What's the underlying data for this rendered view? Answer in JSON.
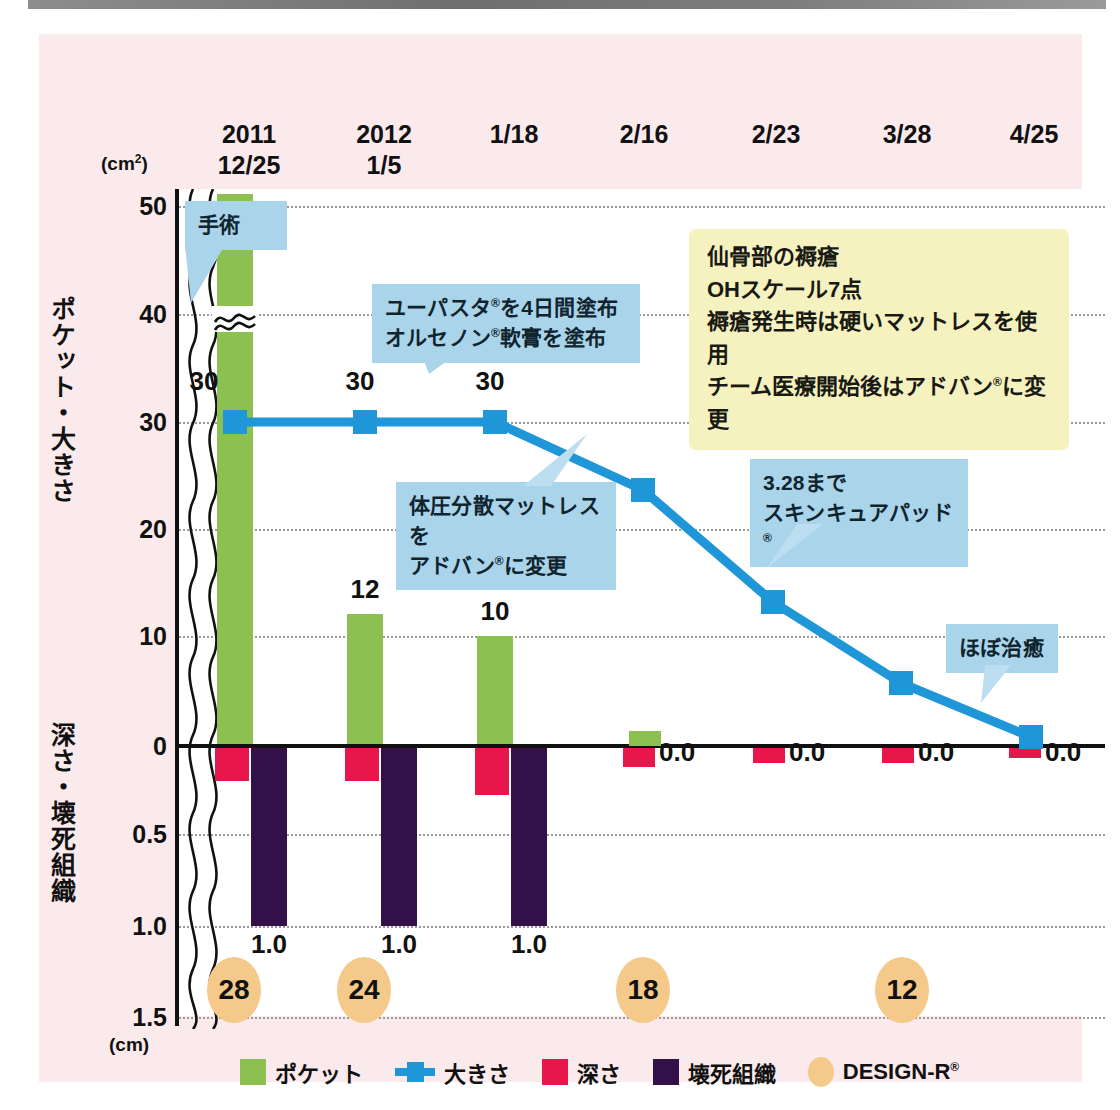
{
  "units": {
    "top": "(cm²)",
    "bottom": "(cm)"
  },
  "axis": {
    "y_label_upper": "ポケット・大きさ",
    "y_label_lower": "深さ・壊死組織",
    "y_ticks_upper": [
      "50",
      "40",
      "30",
      "20",
      "10",
      "0"
    ],
    "y_ticks_lower": [
      "0.5",
      "1.0",
      "1.5"
    ]
  },
  "dates": [
    {
      "year": "2011",
      "day": "12/25"
    },
    {
      "year": "2012",
      "day": "1/5"
    },
    {
      "year": "",
      "day": "1/18"
    },
    {
      "year": "",
      "day": "2/16"
    },
    {
      "year": "",
      "day": "2/23"
    },
    {
      "year": "",
      "day": "3/28"
    },
    {
      "year": "",
      "day": "4/25"
    }
  ],
  "notes": {
    "yellow": [
      "仙骨部の褥瘡",
      "OHスケール7点",
      "褥瘡発生時は硬いマットレスを使用",
      "チーム医療開始後はアドバン®に変更"
    ],
    "surgery": "手術",
    "ointment_l1": "ユーパスタ®を4日間塗布",
    "ointment_l2": "オルセノン®軟膏を塗布",
    "mattress_l1": "体圧分散マットレスを",
    "mattress_l2": "アドバン®に変更",
    "skincure_l1": "3.28まで",
    "skincure_l2": "スキンキュアパッド®",
    "healed": "ほぼ治癒"
  },
  "legend": [
    {
      "key": "pocket",
      "label": "ポケット",
      "color": "#8cc152"
    },
    {
      "key": "size",
      "label": "大きさ",
      "color": "#1f96d8"
    },
    {
      "key": "depth",
      "label": "深さ",
      "color": "#e8174b"
    },
    {
      "key": "necrosis",
      "label": "壊死組織",
      "color": "#331047"
    },
    {
      "key": "designr",
      "label": "DESIGN-R®",
      "color": "#f5c98a"
    }
  ],
  "chart_data": {
    "type": "bar",
    "title": "",
    "xlabel": "",
    "ylabel": "ポケット・大きさ / 深さ・壊死組織",
    "categories": [
      "12/25",
      "1/5",
      "1/18",
      "2/16",
      "2/23",
      "3/28",
      "4/25"
    ],
    "ylim_upper": [
      0,
      50
    ],
    "ylim_lower": [
      0,
      1.5
    ],
    "grid": true,
    "legend_position": "bottom",
    "axis_break": true,
    "series": [
      {
        "name": "ポケット",
        "type": "bar",
        "unit": "cm2",
        "color": "#8cc152",
        "values": [
          62,
          12,
          10,
          1,
          0,
          0,
          0
        ],
        "labels": [
          "",
          "12",
          "10",
          "",
          "",
          "",
          ""
        ],
        "truncated_at_index": 0
      },
      {
        "name": "大きさ",
        "type": "line",
        "unit": "cm2",
        "color": "#1f96d8",
        "values": [
          30,
          30,
          30,
          22.5,
          11.8,
          4.3,
          0.5
        ],
        "labels": [
          "30",
          "30",
          "30",
          "",
          "",
          "",
          ""
        ]
      },
      {
        "name": "深さ",
        "type": "bar",
        "unit": "cm",
        "color": "#e8174b",
        "values": [
          0.13,
          0.13,
          0.2,
          0.05,
          0.04,
          0.04,
          0.02
        ],
        "labels": [
          "",
          "",
          "",
          "0.0",
          "0.0",
          "0.0",
          "0.0"
        ]
      },
      {
        "name": "壊死組織",
        "type": "bar",
        "unit": "cm",
        "color": "#331047",
        "values": [
          1.0,
          1.0,
          1.0,
          0,
          0,
          0,
          0
        ],
        "labels": [
          "1.0",
          "1.0",
          "1.0",
          "",
          "",
          "",
          ""
        ]
      },
      {
        "name": "DESIGN-R®",
        "type": "marker",
        "color": "#f5c98a",
        "values": [
          28,
          24,
          null,
          18,
          null,
          12,
          null
        ],
        "labels": [
          "28",
          "24",
          "",
          "18",
          "",
          "12",
          ""
        ]
      }
    ]
  }
}
